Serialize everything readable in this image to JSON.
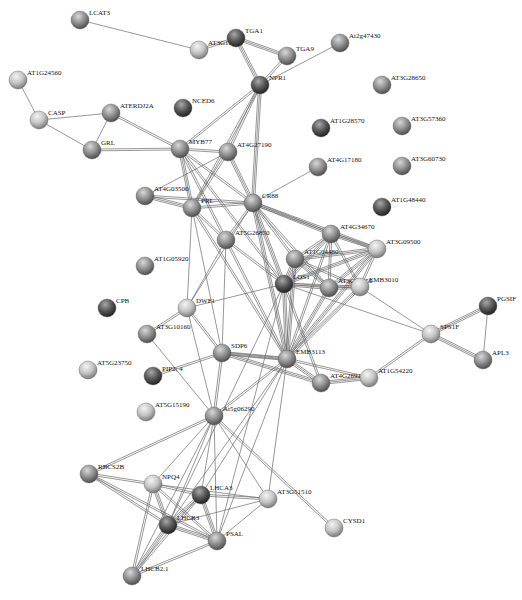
{
  "colors": {
    "background": "#ffffff",
    "node_light": "#d6d6d6",
    "node_mid": "#8f8f8f",
    "node_dark": "#3e3e3e",
    "edge": "#6b6b6b",
    "label": "#111111"
  },
  "nodes": [
    {
      "id": "LCAT3",
      "label": "LCAT3",
      "x": 80,
      "y": 20,
      "shade": "mid"
    },
    {
      "id": "AT3G10250",
      "label": "AT3G10250",
      "x": 199,
      "y": 50,
      "shade": "light"
    },
    {
      "id": "TGA1",
      "label": "TGA1",
      "x": 236,
      "y": 38,
      "shade": "dark"
    },
    {
      "id": "TGA9",
      "label": "TGA9",
      "x": 287,
      "y": 56,
      "shade": "mid"
    },
    {
      "id": "At2g47430",
      "label": "At2g47430",
      "x": 340,
      "y": 43,
      "shade": "mid"
    },
    {
      "id": "NPR1",
      "label": "NPR1",
      "x": 260,
      "y": 85,
      "shade": "dark"
    },
    {
      "id": "AT1G24560",
      "label": "AT1G24560",
      "x": 18,
      "y": 80,
      "shade": "light"
    },
    {
      "id": "CASP",
      "label": "CASP",
      "x": 39,
      "y": 120,
      "shade": "light"
    },
    {
      "id": "ATERDJ2A",
      "label": "ATERDJ2A",
      "x": 111,
      "y": 113,
      "shade": "mid"
    },
    {
      "id": "NCED6",
      "label": "NCED6",
      "x": 183,
      "y": 108,
      "shade": "dark"
    },
    {
      "id": "GRL",
      "label": "GRL",
      "x": 92,
      "y": 150,
      "shade": "mid"
    },
    {
      "id": "MYB77",
      "label": "MYB77",
      "x": 180,
      "y": 149,
      "shade": "mid"
    },
    {
      "id": "AT4G27190",
      "label": "AT4G27190",
      "x": 228,
      "y": 152,
      "shade": "mid"
    },
    {
      "id": "AT3G28650",
      "label": "AT3G28650",
      "x": 382,
      "y": 85,
      "shade": "mid"
    },
    {
      "id": "AT1G28570",
      "label": "AT1G28570",
      "x": 321,
      "y": 128,
      "shade": "dark"
    },
    {
      "id": "AT3G57360",
      "label": "AT3G57360",
      "x": 402,
      "y": 126,
      "shade": "mid"
    },
    {
      "id": "AT4G17180",
      "label": "AT4G17180",
      "x": 318,
      "y": 167,
      "shade": "mid"
    },
    {
      "id": "AT3G60730",
      "label": "AT3G60730",
      "x": 402,
      "y": 166,
      "shade": "mid"
    },
    {
      "id": "AT1G48440",
      "label": "AT1G48440",
      "x": 382,
      "y": 207,
      "shade": "dark"
    },
    {
      "id": "AT4G03500",
      "label": "AT4G03500",
      "x": 145,
      "y": 196,
      "shade": "mid"
    },
    {
      "id": "PRL",
      "label": "PRL",
      "x": 192,
      "y": 208,
      "shade": "mid"
    },
    {
      "id": "CR88",
      "label": "CR88",
      "x": 253,
      "y": 203,
      "shade": "mid"
    },
    {
      "id": "AT5G26850",
      "label": "AT5G26850",
      "x": 226,
      "y": 240,
      "shade": "mid"
    },
    {
      "id": "AT4G34670",
      "label": "AT4G34670",
      "x": 331,
      "y": 234,
      "shade": "mid"
    },
    {
      "id": "AT3G09500",
      "label": "AT3G09500",
      "x": 377,
      "y": 249,
      "shade": "light"
    },
    {
      "id": "AT1G04480",
      "label": "AT1G04480",
      "x": 295,
      "y": 259,
      "shade": "mid"
    },
    {
      "id": "LOS1",
      "label": "LOS1",
      "x": 284,
      "y": 284,
      "shade": "dark"
    },
    {
      "id": "AT3G27850",
      "label": "AT3G27850",
      "x": 329,
      "y": 288,
      "shade": "mid"
    },
    {
      "id": "EMB3010",
      "label": "EMB3010",
      "x": 360,
      "y": 287,
      "shade": "light"
    },
    {
      "id": "AT1G05920",
      "label": "AT1G05920",
      "x": 145,
      "y": 266,
      "shade": "mid"
    },
    {
      "id": "DWF1",
      "label": "DWF1",
      "x": 187,
      "y": 308,
      "shade": "light"
    },
    {
      "id": "CPB",
      "label": "CPB",
      "x": 107,
      "y": 308,
      "shade": "dark"
    },
    {
      "id": "AT3G10160",
      "label": "AT3G10160",
      "x": 147,
      "y": 334,
      "shade": "mid"
    },
    {
      "id": "SDP6",
      "label": "SDP6",
      "x": 222,
      "y": 353,
      "shade": "mid"
    },
    {
      "id": "PIP2_4",
      "label": "PIP2; 4",
      "x": 153,
      "y": 376,
      "shade": "dark"
    },
    {
      "id": "AT5G23750",
      "label": "AT5G23750",
      "x": 88,
      "y": 370,
      "shade": "light"
    },
    {
      "id": "EMB3113",
      "label": "EMB3113",
      "x": 287,
      "y": 359,
      "shade": "mid"
    },
    {
      "id": "AT4G26910",
      "label": "AT4G26910",
      "x": 321,
      "y": 383,
      "shade": "mid"
    },
    {
      "id": "AT1G54220",
      "label": "AT1G54220",
      "x": 369,
      "y": 378,
      "shade": "light"
    },
    {
      "id": "SPS1F",
      "label": "SPS1F",
      "x": 431,
      "y": 334,
      "shade": "light"
    },
    {
      "id": "PGSIF",
      "label": "PGSIF",
      "x": 488,
      "y": 306,
      "shade": "dark"
    },
    {
      "id": "APL3",
      "label": "APL3",
      "x": 483,
      "y": 360,
      "shade": "mid"
    },
    {
      "id": "AT5G15190",
      "label": "AT5G15190",
      "x": 146,
      "y": 412,
      "shade": "light"
    },
    {
      "id": "At5g06290",
      "label": "At5g06290",
      "x": 214,
      "y": 416,
      "shade": "mid"
    },
    {
      "id": "RBCS2B",
      "label": "RBCS2B",
      "x": 89,
      "y": 474,
      "shade": "mid"
    },
    {
      "id": "NPQ4",
      "label": "NPQ4",
      "x": 153,
      "y": 484,
      "shade": "light"
    },
    {
      "id": "LHCA3",
      "label": "LHCA3",
      "x": 201,
      "y": 495,
      "shade": "dark"
    },
    {
      "id": "AT3G51510",
      "label": "AT3G51510",
      "x": 268,
      "y": 499,
      "shade": "light"
    },
    {
      "id": "LHCB3",
      "label": "LHCB3",
      "x": 168,
      "y": 525,
      "shade": "dark"
    },
    {
      "id": "PSAL",
      "label": "PSAL",
      "x": 217,
      "y": 541,
      "shade": "mid"
    },
    {
      "id": "CYSD1",
      "label": "CYSD1",
      "x": 334,
      "y": 528,
      "shade": "light"
    },
    {
      "id": "LHCB2_1",
      "label": "LHCB2.1",
      "x": 132,
      "y": 576,
      "shade": "mid"
    }
  ],
  "edges": [
    [
      "LCAT3",
      "AT3G10250",
      1
    ],
    [
      "AT3G10250",
      "TGA1",
      2
    ],
    [
      "TGA1",
      "TGA9",
      3
    ],
    [
      "TGA1",
      "NPR1",
      3
    ],
    [
      "TGA9",
      "NPR1",
      2
    ],
    [
      "NPR1",
      "At2g47430",
      1
    ],
    [
      "AT1G24560",
      "CASP",
      1
    ],
    [
      "CASP",
      "ATERDJ2A",
      1
    ],
    [
      "CASP",
      "GRL",
      1
    ],
    [
      "ATERDJ2A",
      "GRL",
      1
    ],
    [
      "GRL",
      "MYB77",
      2
    ],
    [
      "ATERDJ2A",
      "MYB77",
      2
    ],
    [
      "NPR1",
      "MYB77",
      2
    ],
    [
      "NPR1",
      "AT4G27190",
      2
    ],
    [
      "NPR1",
      "CR88",
      3
    ],
    [
      "NPR1",
      "PRL",
      2
    ],
    [
      "MYB77",
      "AT4G27190",
      2
    ],
    [
      "MYB77",
      "PRL",
      3
    ],
    [
      "MYB77",
      "CR88",
      2
    ],
    [
      "MYB77",
      "LOS1",
      2
    ],
    [
      "MYB77",
      "AT5G26850",
      2
    ],
    [
      "AT4G27190",
      "CR88",
      3
    ],
    [
      "AT4G27190",
      "PRL",
      2
    ],
    [
      "AT4G27190",
      "AT4G03500",
      1
    ],
    [
      "AT4G03500",
      "PRL",
      3
    ],
    [
      "AT4G03500",
      "CR88",
      2
    ],
    [
      "PRL",
      "CR88",
      2
    ],
    [
      "PRL",
      "AT5G26850",
      2
    ],
    [
      "PRL",
      "DWF1",
      1
    ],
    [
      "PRL",
      "SDP6",
      1
    ],
    [
      "PRL",
      "EMB3113",
      2
    ],
    [
      "CR88",
      "AT4G17180",
      1
    ],
    [
      "CR88",
      "AT5G26850",
      2
    ],
    [
      "CR88",
      "AT4G34670",
      3
    ],
    [
      "CR88",
      "AT3G09500",
      3
    ],
    [
      "CR88",
      "AT1G04480",
      2
    ],
    [
      "CR88",
      "LOS1",
      3
    ],
    [
      "CR88",
      "AT3G27850",
      2
    ],
    [
      "CR88",
      "EMB3113",
      3
    ],
    [
      "CR88",
      "DWF1",
      1
    ],
    [
      "AT5G26850",
      "LOS1",
      2
    ],
    [
      "AT5G26850",
      "EMB3113",
      2
    ],
    [
      "AT5G26850",
      "DWF1",
      1
    ],
    [
      "AT5G26850",
      "SDP6",
      1
    ],
    [
      "AT4G34670",
      "AT3G09500",
      3
    ],
    [
      "AT4G34670",
      "AT1G04480",
      2
    ],
    [
      "AT4G34670",
      "LOS1",
      3
    ],
    [
      "AT4G34670",
      "AT3G27850",
      2
    ],
    [
      "AT4G34670",
      "EMB3010",
      2
    ],
    [
      "AT4G34670",
      "EMB3113",
      2
    ],
    [
      "AT3G09500",
      "AT1G04480",
      3
    ],
    [
      "AT3G09500",
      "LOS1",
      3
    ],
    [
      "AT3G09500",
      "AT3G27850",
      3
    ],
    [
      "AT3G09500",
      "EMB3010",
      2
    ],
    [
      "AT3G09500",
      "EMB3113",
      3
    ],
    [
      "AT1G04480",
      "LOS1",
      3
    ],
    [
      "AT1G04480",
      "AT3G27850",
      3
    ],
    [
      "AT1G04480",
      "EMB3010",
      2
    ],
    [
      "AT1G04480",
      "EMB3113",
      3
    ],
    [
      "LOS1",
      "AT3G27850",
      3
    ],
    [
      "LOS1",
      "EMB3010",
      2
    ],
    [
      "LOS1",
      "EMB3113",
      3
    ],
    [
      "LOS1",
      "SPS1F",
      1
    ],
    [
      "LOS1",
      "AT4G26910",
      2
    ],
    [
      "LOS1",
      "DWF1",
      1
    ],
    [
      "AT3G27850",
      "EMB3010",
      3
    ],
    [
      "AT3G27850",
      "EMB3113",
      3
    ],
    [
      "EMB3010",
      "EMB3113",
      3
    ],
    [
      "EMB3010",
      "SPS1F",
      1
    ],
    [
      "EMB3113",
      "AT4G26910",
      3
    ],
    [
      "EMB3113",
      "AT1G54220",
      2
    ],
    [
      "EMB3113",
      "SDP6",
      3
    ],
    [
      "EMB3113",
      "At5g06290",
      2
    ],
    [
      "AT4G26910",
      "AT1G54220",
      3
    ],
    [
      "AT1G54220",
      "SPS1F",
      2
    ],
    [
      "SPS1F",
      "PGSIF",
      3
    ],
    [
      "SPS1F",
      "APL3",
      3
    ],
    [
      "PGSIF",
      "APL3",
      1
    ],
    [
      "AT3G10160",
      "DWF1",
      2
    ],
    [
      "DWF1",
      "SDP6",
      2
    ],
    [
      "DWF1",
      "At5g06290",
      1
    ],
    [
      "AT3G10160",
      "At5g06290",
      1
    ],
    [
      "PIP2_4",
      "SDP6",
      2
    ],
    [
      "SDP6",
      "At5g06290",
      2
    ],
    [
      "SDP6",
      "AT4G26910",
      3
    ],
    [
      "SDP6",
      "EMB3113",
      2
    ],
    [
      "At5g06290",
      "RBCS2B",
      2
    ],
    [
      "At5g06290",
      "NPQ4",
      1
    ],
    [
      "At5g06290",
      "LHCA3",
      1
    ],
    [
      "At5g06290",
      "LHCB3",
      1
    ],
    [
      "At5g06290",
      "PSAL",
      1
    ],
    [
      "At5g06290",
      "LHCB2_1",
      1
    ],
    [
      "At5g06290",
      "AT3G51510",
      1
    ],
    [
      "At5g06290",
      "CYSD1",
      2
    ],
    [
      "EMB3113",
      "LHCA3",
      1
    ],
    [
      "EMB3113",
      "LHCB3",
      1
    ],
    [
      "EMB3113",
      "PSAL",
      1
    ],
    [
      "EMB3113",
      "AT3G51510",
      1
    ],
    [
      "LOS1",
      "LHCB3",
      1
    ],
    [
      "LOS1",
      "PSAL",
      1
    ],
    [
      "RBCS2B",
      "NPQ4",
      2
    ],
    [
      "RBCS2B",
      "LHCB3",
      2
    ],
    [
      "RBCS2B",
      "PSAL",
      2
    ],
    [
      "NPQ4",
      "LHCA3",
      2
    ],
    [
      "NPQ4",
      "LHCB3",
      3
    ],
    [
      "NPQ4",
      "PSAL",
      2
    ],
    [
      "NPQ4",
      "LHCB2_1",
      2
    ],
    [
      "NPQ4",
      "AT3G51510",
      1
    ],
    [
      "LHCA3",
      "LHCB3",
      3
    ],
    [
      "LHCA3",
      "PSAL",
      3
    ],
    [
      "LHCA3",
      "AT3G51510",
      2
    ],
    [
      "LHCA3",
      "LHCB2_1",
      2
    ],
    [
      "LHCB3",
      "PSAL",
      3
    ],
    [
      "LHCB3",
      "LHCB2_1",
      3
    ],
    [
      "LHCB3",
      "AT3G51510",
      1
    ],
    [
      "PSAL",
      "LHCB2_1",
      2
    ],
    [
      "PSAL",
      "AT3G51510",
      1
    ]
  ]
}
